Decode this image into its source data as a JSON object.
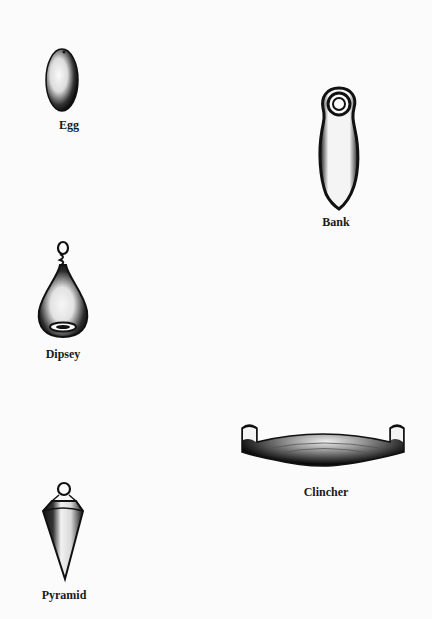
{
  "sinkers": [
    {
      "name": "Egg",
      "label": "Egg"
    },
    {
      "name": "Bank",
      "label": "Bank"
    },
    {
      "name": "Dipsey",
      "label": "Dipsey"
    },
    {
      "name": "Clincher",
      "label": "Clincher"
    },
    {
      "name": "Pyramid",
      "label": "Pyramid"
    }
  ],
  "colors": {
    "ink": "#111111",
    "paper": "#fbfbfb",
    "highlight": "#f2f2f2"
  }
}
